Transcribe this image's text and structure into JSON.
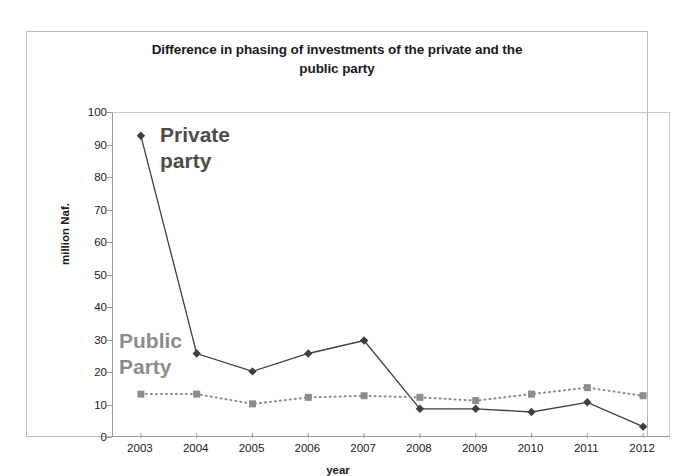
{
  "chart_data": {
    "type": "line",
    "title": "Difference in phasing of investments of the private and the public party",
    "title_line1": "Difference in phasing of investments of the private and the",
    "title_line2": "public party",
    "xlabel": "year",
    "ylabel": "million Naf.",
    "categories": [
      "2003",
      "2004",
      "2005",
      "2006",
      "2007",
      "2008",
      "2009",
      "2010",
      "2011",
      "2012"
    ],
    "x": [
      2003,
      2004,
      2005,
      2006,
      2007,
      2008,
      2009,
      2010,
      2011,
      2012
    ],
    "ylim": [
      0,
      100
    ],
    "yticks": [
      0,
      10,
      20,
      30,
      40,
      50,
      60,
      70,
      80,
      90,
      100
    ],
    "grid": false,
    "legend_position": "inline-annotations",
    "series": [
      {
        "name": "Private party",
        "marker": "diamond",
        "line_style": "solid",
        "color": "#3f3f3f",
        "values": [
          93,
          26,
          20.5,
          26,
          30,
          9,
          9,
          8,
          11,
          3.5
        ]
      },
      {
        "name": "Public Party",
        "marker": "square",
        "line_style": "dotted",
        "color": "#8c8c8c",
        "values": [
          13.5,
          13.5,
          10.5,
          12.5,
          13,
          12.5,
          11.5,
          13.5,
          15.5,
          13
        ]
      }
    ],
    "annotations": [
      {
        "id": "private",
        "text": "Private\nparty",
        "color": "#4c4c4c"
      },
      {
        "id": "public",
        "text": "Public\nParty",
        "color": "#8c8c8c"
      }
    ]
  }
}
